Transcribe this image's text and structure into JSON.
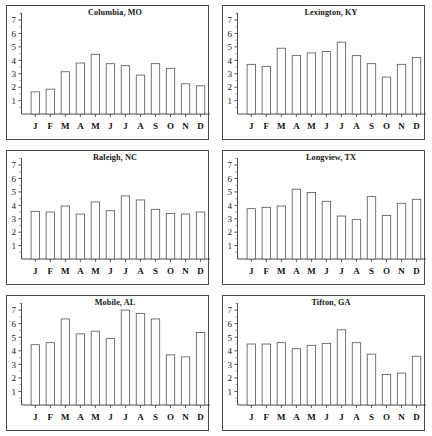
{
  "figure": {
    "layout": "2 columns x 3 rows",
    "panel_count": 6
  },
  "axis": {
    "y_ticks": [
      "1",
      "2",
      "3",
      "4",
      "5",
      "6",
      "7"
    ],
    "x_ticks": [
      "J",
      "F",
      "M",
      "A",
      "M",
      "J",
      "J",
      "A",
      "S",
      "O",
      "N",
      "D"
    ],
    "y_min": 0,
    "y_max": 7.6,
    "minor_ticks": true
  },
  "colors": {
    "bar_fill": "#ffffff",
    "bar_stroke": "#5c5c5c",
    "axis": "#4d4d4d",
    "frame": "#4a4a4a",
    "text": "#141414",
    "background": "#ffffff"
  },
  "chart_data": [
    {
      "type": "bar",
      "title": "Columbia, MO",
      "xlabel": "",
      "ylabel": "",
      "categories": [
        "J",
        "F",
        "M",
        "A",
        "M",
        "J",
        "J",
        "A",
        "S",
        "O",
        "N",
        "D"
      ],
      "values": [
        1.65,
        1.85,
        3.15,
        3.8,
        4.45,
        3.75,
        3.6,
        2.9,
        3.75,
        3.4,
        2.25,
        2.1
      ],
      "ylim": [
        0,
        7.6
      ],
      "grid": false,
      "legend": "none"
    },
    {
      "type": "bar",
      "title": "Lexington, KY",
      "xlabel": "",
      "ylabel": "",
      "categories": [
        "J",
        "F",
        "M",
        "A",
        "M",
        "J",
        "J",
        "A",
        "S",
        "O",
        "N",
        "D"
      ],
      "values": [
        3.7,
        3.55,
        4.9,
        4.35,
        4.55,
        4.65,
        5.35,
        4.35,
        3.75,
        2.75,
        3.7,
        4.2
      ],
      "ylim": [
        0,
        7.6
      ],
      "grid": false,
      "legend": "none"
    },
    {
      "type": "bar",
      "title": "Raleigh, NC",
      "xlabel": "",
      "ylabel": "",
      "categories": [
        "J",
        "F",
        "M",
        "A",
        "M",
        "J",
        "J",
        "A",
        "S",
        "O",
        "N",
        "D"
      ],
      "values": [
        3.55,
        3.5,
        3.95,
        3.35,
        4.25,
        3.6,
        4.7,
        4.4,
        3.7,
        3.4,
        3.35,
        3.5
      ],
      "ylim": [
        0,
        7.6
      ],
      "grid": false,
      "legend": "none"
    },
    {
      "type": "bar",
      "title": "Longview, TX",
      "xlabel": "",
      "ylabel": "",
      "categories": [
        "J",
        "F",
        "M",
        "A",
        "M",
        "J",
        "J",
        "A",
        "S",
        "O",
        "N",
        "D"
      ],
      "values": [
        3.75,
        3.85,
        3.95,
        5.2,
        4.95,
        4.3,
        3.2,
        2.95,
        4.65,
        3.25,
        4.15,
        4.45
      ],
      "ylim": [
        0,
        7.6
      ],
      "grid": false,
      "legend": "none"
    },
    {
      "type": "bar",
      "title": "Mobile, AL",
      "xlabel": "",
      "ylabel": "",
      "categories": [
        "J",
        "F",
        "M",
        "A",
        "M",
        "J",
        "J",
        "A",
        "S",
        "O",
        "N",
        "D"
      ],
      "values": [
        4.45,
        4.6,
        6.35,
        5.25,
        5.45,
        4.9,
        7.0,
        6.75,
        6.35,
        3.7,
        3.55,
        5.35
      ],
      "ylim": [
        0,
        7.6
      ],
      "grid": false,
      "legend": "none"
    },
    {
      "type": "bar",
      "title": "Tifton, GA",
      "xlabel": "",
      "ylabel": "",
      "categories": [
        "J",
        "F",
        "M",
        "A",
        "M",
        "J",
        "J",
        "A",
        "S",
        "O",
        "N",
        "D"
      ],
      "values": [
        4.5,
        4.5,
        4.6,
        4.15,
        4.4,
        4.55,
        5.55,
        4.6,
        3.75,
        2.25,
        2.35,
        3.6
      ],
      "ylim": [
        0,
        7.6
      ],
      "grid": false,
      "legend": "none"
    }
  ]
}
